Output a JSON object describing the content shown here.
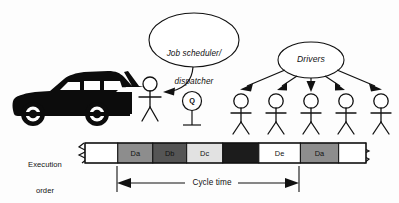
{
  "figure": {
    "type": "schematic-diagram",
    "caption_elements": {
      "scheduler_ellipse": "Job scheduler/\ndispatcher",
      "scheduler_ellipse_line1": "Job scheduler/",
      "scheduler_ellipse_line2": "dispatcher",
      "drivers_ellipse": "Drivers",
      "queue_symbol": "Q",
      "execution_order_line1": "Execution",
      "execution_order_line2": "order",
      "cycle_time": "Cycle time"
    },
    "actors": {
      "vehicle": "car-silhouette",
      "dispatcher_person": "stick-figure",
      "driver_count": 5
    }
  },
  "chart_data": {
    "type": "bar",
    "title": "Execution order",
    "orientation": "horizontal-timeline",
    "xlabel": "Cycle time",
    "ylabel": "",
    "grid": false,
    "legend": null,
    "categories": [
      "",
      "Da",
      "Db",
      "Dc",
      "",
      "De",
      "Da",
      ""
    ],
    "segments": [
      {
        "label": "",
        "fill": "#ffffff",
        "width_px": 30,
        "text_color": "#111111"
      },
      {
        "label": "Da",
        "fill": "#8d8d8d",
        "width_px": 32,
        "text_color": "#111111"
      },
      {
        "label": "Db",
        "fill": "#555555",
        "width_px": 31,
        "text_color": "#111111"
      },
      {
        "label": "Dc",
        "fill": "#e2e2e2",
        "width_px": 33,
        "text_color": "#111111"
      },
      {
        "label": "",
        "fill": "#1c1c1c",
        "width_px": 33,
        "text_color": "#ffffff"
      },
      {
        "label": "De",
        "fill": "#ffffff",
        "width_px": 38,
        "text_color": "#111111"
      },
      {
        "label": "Da",
        "fill": "#8d8d8d",
        "width_px": 35,
        "text_color": "#111111"
      },
      {
        "label": "",
        "fill": "#ffffff",
        "width_px": 25,
        "text_color": "#111111"
      }
    ],
    "cycle_span": {
      "from_segment_index": 1,
      "to_segment_index": 6,
      "annotation": "Cycle time"
    },
    "broken_ends": {
      "left": true,
      "right": true
    }
  },
  "colors": {
    "stroke": "#111111",
    "vehicle": "#0c0c0c",
    "gray_mid": "#8d8d8d",
    "gray_dark": "#555555",
    "gray_light": "#e2e2e2",
    "black_block": "#1c1c1c",
    "white": "#ffffff"
  }
}
